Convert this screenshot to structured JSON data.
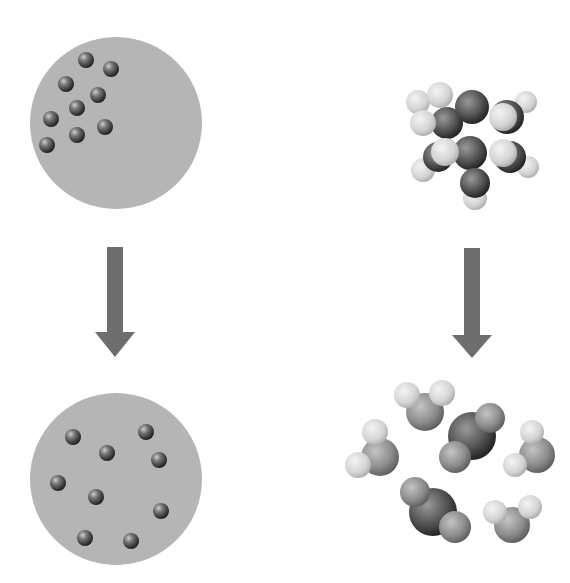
{
  "figure": {
    "width": 570,
    "height": 583,
    "background": "#ffffff",
    "colors": {
      "container_fill": "#b5b5b5",
      "arrow_fill": "#6e6e6e",
      "particle_dark": "#3a3a3a",
      "atom_carbon": "#4a4a4a",
      "atom_oxygen": "#8a8a8a",
      "atom_hydrogen": "#d8d8d8"
    },
    "panels": {
      "top_left": {
        "label": "particles-clustered",
        "container": {
          "cx": 116,
          "cy": 123,
          "r": 86
        },
        "particles": [
          {
            "cx": 86,
            "cy": 60,
            "r": 8
          },
          {
            "cx": 111,
            "cy": 69,
            "r": 8
          },
          {
            "cx": 66,
            "cy": 84,
            "r": 8
          },
          {
            "cx": 98,
            "cy": 95,
            "r": 8
          },
          {
            "cx": 77,
            "cy": 108,
            "r": 8
          },
          {
            "cx": 51,
            "cy": 119,
            "r": 8
          },
          {
            "cx": 105,
            "cy": 127,
            "r": 8
          },
          {
            "cx": 77,
            "cy": 135,
            "r": 8
          },
          {
            "cx": 47,
            "cy": 145,
            "r": 8
          }
        ]
      },
      "bottom_left": {
        "label": "particles-dispersed",
        "container": {
          "cx": 116,
          "cy": 479,
          "r": 86
        },
        "particles": [
          {
            "cx": 73,
            "cy": 437,
            "r": 8
          },
          {
            "cx": 146,
            "cy": 432,
            "r": 8
          },
          {
            "cx": 107,
            "cy": 453,
            "r": 8
          },
          {
            "cx": 159,
            "cy": 460,
            "r": 8
          },
          {
            "cx": 58,
            "cy": 483,
            "r": 8
          },
          {
            "cx": 96,
            "cy": 497,
            "r": 8
          },
          {
            "cx": 161,
            "cy": 511,
            "r": 8
          },
          {
            "cx": 85,
            "cy": 538,
            "r": 8
          },
          {
            "cx": 131,
            "cy": 541,
            "r": 8
          }
        ]
      },
      "top_right": {
        "label": "reactant-molecule",
        "atoms": [
          {
            "type": "hydrogen",
            "cx": 418,
            "cy": 102,
            "r": 12
          },
          {
            "type": "hydrogen",
            "cx": 526,
            "cy": 102,
            "r": 11
          },
          {
            "type": "hydrogen",
            "cx": 423,
            "cy": 170,
            "r": 12
          },
          {
            "type": "hydrogen",
            "cx": 528,
            "cy": 167,
            "r": 11
          },
          {
            "type": "hydrogen",
            "cx": 475,
            "cy": 198,
            "r": 12
          },
          {
            "type": "carbon",
            "cx": 447,
            "cy": 123,
            "r": 16
          },
          {
            "type": "carbon",
            "cx": 507,
            "cy": 117,
            "r": 17
          },
          {
            "type": "carbon",
            "cx": 472,
            "cy": 107,
            "r": 17
          },
          {
            "type": "carbon",
            "cx": 438,
            "cy": 157,
            "r": 15
          },
          {
            "type": "carbon",
            "cx": 510,
            "cy": 157,
            "r": 16
          },
          {
            "type": "carbon",
            "cx": 470,
            "cy": 153,
            "r": 17
          },
          {
            "type": "carbon",
            "cx": 475,
            "cy": 183,
            "r": 15
          },
          {
            "type": "hydrogen",
            "cx": 440,
            "cy": 95,
            "r": 13
          },
          {
            "type": "hydrogen",
            "cx": 423,
            "cy": 123,
            "r": 13
          },
          {
            "type": "hydrogen",
            "cx": 503,
            "cy": 117,
            "r": 14
          },
          {
            "type": "hydrogen",
            "cx": 445,
            "cy": 152,
            "r": 14
          },
          {
            "type": "hydrogen",
            "cx": 503,
            "cy": 153,
            "r": 14
          }
        ]
      },
      "bottom_right": {
        "label": "product-molecules",
        "molecules": [
          {
            "name": "water-1",
            "atoms": [
              {
                "type": "oxygen",
                "cx": 425,
                "cy": 412,
                "r": 19
              },
              {
                "type": "hydrogen",
                "cx": 407,
                "cy": 395,
                "r": 13
              },
              {
                "type": "hydrogen",
                "cx": 442,
                "cy": 393,
                "r": 13
              }
            ]
          },
          {
            "name": "water-2",
            "atoms": [
              {
                "type": "oxygen",
                "cx": 380,
                "cy": 457,
                "r": 19
              },
              {
                "type": "hydrogen",
                "cx": 375,
                "cy": 432,
                "r": 13
              },
              {
                "type": "hydrogen",
                "cx": 358,
                "cy": 465,
                "r": 13
              }
            ]
          },
          {
            "name": "water-3",
            "atoms": [
              {
                "type": "oxygen",
                "cx": 537,
                "cy": 455,
                "r": 18
              },
              {
                "type": "hydrogen",
                "cx": 532,
                "cy": 432,
                "r": 12
              },
              {
                "type": "hydrogen",
                "cx": 515,
                "cy": 465,
                "r": 12
              }
            ]
          },
          {
            "name": "water-4",
            "atoms": [
              {
                "type": "oxygen",
                "cx": 512,
                "cy": 525,
                "r": 18
              },
              {
                "type": "hydrogen",
                "cx": 495,
                "cy": 512,
                "r": 12
              },
              {
                "type": "hydrogen",
                "cx": 530,
                "cy": 507,
                "r": 12
              }
            ]
          },
          {
            "name": "carbon-dioxide-1",
            "atoms": [
              {
                "type": "carbon",
                "cx": 472,
                "cy": 436,
                "r": 24
              },
              {
                "type": "oxygen",
                "cx": 490,
                "cy": 418,
                "r": 15
              },
              {
                "type": "oxygen",
                "cx": 455,
                "cy": 457,
                "r": 16
              }
            ]
          },
          {
            "name": "carbon-dioxide-2",
            "atoms": [
              {
                "type": "carbon",
                "cx": 433,
                "cy": 512,
                "r": 24
              },
              {
                "type": "oxygen",
                "cx": 415,
                "cy": 492,
                "r": 15
              },
              {
                "type": "oxygen",
                "cx": 455,
                "cy": 527,
                "r": 16
              }
            ]
          }
        ]
      }
    },
    "arrows": [
      {
        "name": "left-down-arrow",
        "x": 115,
        "y_top": 247,
        "y_bottom": 357,
        "shaft_w": 16,
        "head_w": 40,
        "head_h": 25
      },
      {
        "name": "right-down-arrow",
        "x": 472,
        "y_top": 248,
        "y_bottom": 358,
        "shaft_w": 16,
        "head_w": 40,
        "head_h": 23
      }
    ]
  }
}
